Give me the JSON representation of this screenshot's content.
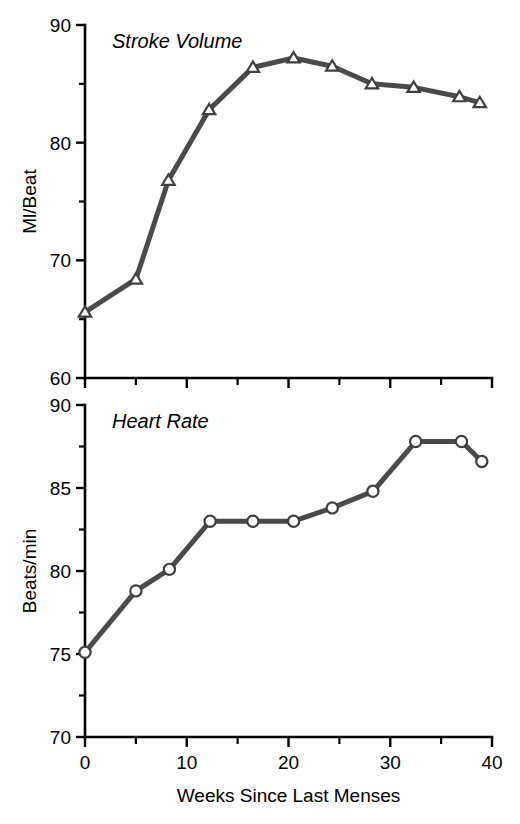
{
  "figure": {
    "background_color": "#ffffff",
    "line_color": "#4a4a4a",
    "marker_fill_color": "#ffffff",
    "marker_edge_color": "#3f3f3f",
    "axis_color": "#000000",
    "xlabel": "Weeks Since Last Menses"
  },
  "chart_data": [
    {
      "type": "line",
      "title": "Stroke Volume",
      "xlabel": "",
      "ylabel": "Ml/Beat",
      "xlim": [
        0,
        40
      ],
      "ylim": [
        60,
        90
      ],
      "grid": false,
      "legend": false,
      "marker": "triangle",
      "xticks": [
        0,
        5,
        10,
        15,
        20,
        25,
        30,
        35,
        40
      ],
      "xtick_labels": [
        "",
        "",
        "",
        "",
        "",
        "",
        "",
        "",
        ""
      ],
      "xticks_major": [
        0,
        10,
        20,
        30,
        40
      ],
      "xticks_minor": [
        5,
        15,
        25,
        35
      ],
      "yticks": [
        60,
        70,
        80,
        90
      ],
      "ytick_labels": [
        "60",
        "70",
        "80",
        "90"
      ],
      "yticks_minor": [
        65,
        75,
        85
      ],
      "x": [
        0,
        5.0,
        8.2,
        12.2,
        16.5,
        20.5,
        24.3,
        28.2,
        32.3,
        36.8,
        38.8
      ],
      "values": [
        65.6,
        68.4,
        76.8,
        82.8,
        86.4,
        87.2,
        86.5,
        85.0,
        84.7,
        83.9,
        83.4
      ]
    },
    {
      "type": "line",
      "title": "Heart Rate",
      "xlabel": "Weeks Since Last Menses",
      "ylabel": "Beats/min",
      "xlim": [
        0,
        40
      ],
      "ylim": [
        70,
        90
      ],
      "grid": false,
      "legend": false,
      "marker": "circle",
      "xticks": [
        0,
        5,
        10,
        15,
        20,
        25,
        30,
        35,
        40
      ],
      "xtick_labels": [
        "0",
        "",
        "10",
        "",
        "20",
        "",
        "30",
        "",
        "40"
      ],
      "xticks_major": [
        0,
        10,
        20,
        30,
        40
      ],
      "xticks_minor": [
        5,
        15,
        25,
        35
      ],
      "yticks": [
        70,
        75,
        80,
        85,
        90
      ],
      "ytick_labels": [
        "70",
        "75",
        "80",
        "85",
        "90"
      ],
      "yticks_minor": [
        72.5,
        77.5,
        82.5,
        87.5
      ],
      "x": [
        0,
        5.0,
        8.3,
        12.3,
        16.5,
        20.5,
        24.3,
        28.3,
        32.5,
        37.0,
        39.0
      ],
      "values": [
        75.1,
        78.8,
        80.1,
        83.0,
        83.0,
        83.0,
        83.8,
        84.8,
        87.8,
        87.8,
        86.6
      ]
    }
  ]
}
